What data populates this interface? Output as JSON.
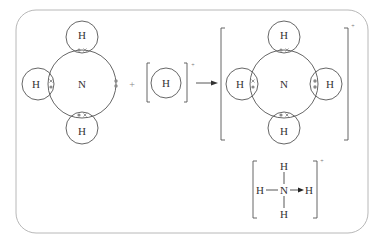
{
  "diagram": {
    "reactant_ammonia": {
      "center_atom": "N",
      "bonded_atoms": [
        "H",
        "H",
        "H"
      ],
      "lone_pair": "dot-dot"
    },
    "operator_plus": "+",
    "reactant_hydrogen_ion": {
      "atom": "H",
      "charge": "+"
    },
    "arrow": "→",
    "product_ammonium": {
      "center_atom": "N",
      "bonded_atoms": [
        "H",
        "H",
        "H",
        "H"
      ],
      "charge": "+"
    },
    "structural_formula": {
      "center_atom": "N",
      "top": "H",
      "bottom": "H",
      "left": "H",
      "right": "H",
      "charge": "+",
      "coordinate_bond": "N → H"
    }
  },
  "colors": {
    "frame": "#b8b8b8",
    "lines": "#555555",
    "electrons": "#8a8a8a"
  }
}
